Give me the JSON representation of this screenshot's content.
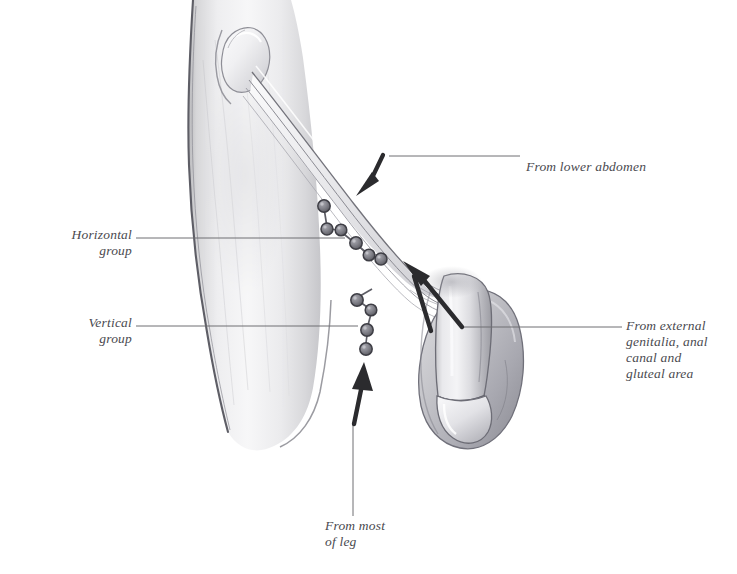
{
  "figure": {
    "background_color": "#ffffff",
    "ink_color": "#4a4a4f",
    "leader_color": "#6e6e73",
    "arrow_color": "#2b2b2e"
  },
  "labels": {
    "horizontal_group": "Horizontal\ngroup",
    "vertical_group": "Vertical\ngroup",
    "from_lower_abdomen": "From lower abdomen",
    "from_external_genitalia": "From external\ngenitalia, anal\ncanal and\ngluteal area",
    "from_most_of_leg": "From most\nof leg"
  },
  "anatomy": {
    "thigh": "upper thigh and hip",
    "iliac_crest": "anterior superior iliac spine",
    "inguinal_ligament": "inguinal ligament",
    "genitalia": "external genitalia",
    "horizontal_node_count": 6,
    "vertical_node_count": 4
  }
}
